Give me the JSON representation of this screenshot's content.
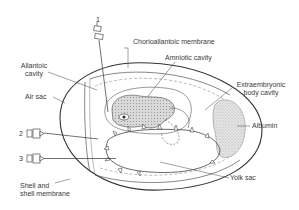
{
  "figure": {
    "labels": {
      "chorioallantoic_membrane": "Chorioallantoic membrane",
      "amniotic_cavity": "Amniotic cavity",
      "allantoic_cavity_line1": "Allantoic",
      "allantoic_cavity_line2": "cavity",
      "air_sac": "Air sac",
      "extraembryonic_line1": "Extraembryonic",
      "extraembryonic_line2": "body cavity",
      "albumin": "Albumin",
      "yolk_sac": "Yolk sac",
      "shell_line1": "Shell and",
      "shell_line2": "shell membrane"
    },
    "needles": [
      {
        "number": "1",
        "target": "Chorioallantoic membrane"
      },
      {
        "number": "2",
        "target": "Allantoic cavity"
      },
      {
        "number": "3",
        "target": "Yolk sac"
      }
    ],
    "colors": {
      "line": "#333333",
      "label": "#3a3a3a",
      "background": "#ffffff"
    }
  }
}
